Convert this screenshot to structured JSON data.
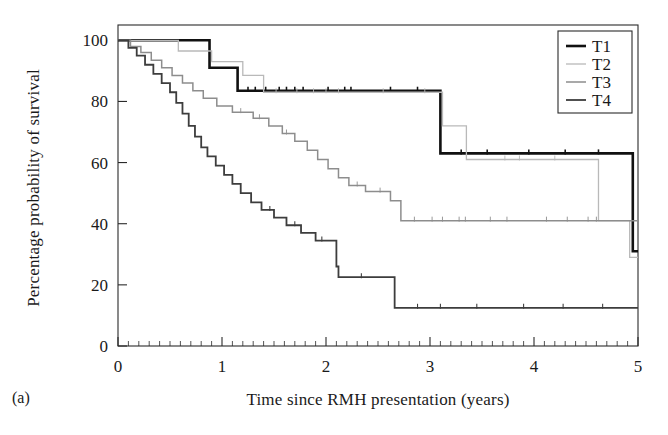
{
  "figure": {
    "panel_tag": "(a)",
    "xlabel": "Time since RMH presentation (years)",
    "ylabel": "Percentage probability of survival"
  },
  "chart_data": {
    "type": "line",
    "title": "",
    "subtitle": "",
    "xlabel": "Time since RMH presentation (years)",
    "ylabel": "Percentage probability of survival",
    "xlim": [
      0,
      5
    ],
    "ylim": [
      0,
      105
    ],
    "xticks": [
      0,
      1,
      2,
      3,
      4,
      5
    ],
    "yticks": [
      0,
      20,
      40,
      60,
      80,
      100
    ],
    "xtick_labels": [
      "0",
      "1",
      "2",
      "3",
      "4",
      "5"
    ],
    "ytick_labels": [
      "0",
      "20",
      "40",
      "60",
      "80",
      "100"
    ],
    "x_minor_tick_interval": 0.1,
    "grid": false,
    "legend_position": "top-right",
    "curve_style": "step-post (Kaplan-Meier survival curves with censor ticks)",
    "series": [
      {
        "name": "T1",
        "color": "#111111",
        "width": 2.6,
        "final_value": 31,
        "steps": [
          [
            0.0,
            100
          ],
          [
            0.88,
            100
          ],
          [
            0.88,
            91.0
          ],
          [
            1.15,
            91.0
          ],
          [
            1.15,
            83.5
          ],
          [
            3.1,
            83.5
          ],
          [
            3.1,
            63.0
          ],
          [
            4.95,
            63.0
          ],
          [
            4.95,
            31.0
          ],
          [
            5.0,
            31.0
          ]
        ],
        "censor_ticks": [
          1.25,
          1.32,
          1.42,
          1.55,
          1.62,
          1.7,
          1.78,
          2.02,
          2.18,
          2.24,
          2.62,
          2.88,
          3.3,
          3.55,
          3.95,
          4.3,
          4.62
        ]
      },
      {
        "name": "T2",
        "color": "#b9b9b9",
        "width": 1.3,
        "final_value": 29,
        "steps": [
          [
            0.0,
            100
          ],
          [
            0.58,
            100
          ],
          [
            0.58,
            96.5
          ],
          [
            0.9,
            96.5
          ],
          [
            0.9,
            93.0
          ],
          [
            1.2,
            93.0
          ],
          [
            1.2,
            88.5
          ],
          [
            1.4,
            88.5
          ],
          [
            1.4,
            83.0
          ],
          [
            3.12,
            83.0
          ],
          [
            3.12,
            72.0
          ],
          [
            3.35,
            72.0
          ],
          [
            3.35,
            61.0
          ],
          [
            4.62,
            61.0
          ],
          [
            4.62,
            41.0
          ],
          [
            4.92,
            41.0
          ],
          [
            4.92,
            29.0
          ],
          [
            5.0,
            29.0
          ]
        ],
        "censor_ticks": [
          1.52,
          1.72,
          1.88,
          2.0,
          2.12,
          2.55,
          2.95,
          3.72,
          3.86,
          4.2
        ]
      },
      {
        "name": "T3",
        "color": "#8d8d8d",
        "width": 1.5,
        "final_value": 41,
        "steps": [
          [
            0.0,
            100
          ],
          [
            0.12,
            100
          ],
          [
            0.12,
            98.0
          ],
          [
            0.22,
            98.0
          ],
          [
            0.22,
            96.0
          ],
          [
            0.32,
            96.0
          ],
          [
            0.32,
            93.5
          ],
          [
            0.42,
            93.5
          ],
          [
            0.42,
            91.0
          ],
          [
            0.52,
            91.0
          ],
          [
            0.52,
            88.5
          ],
          [
            0.62,
            88.5
          ],
          [
            0.62,
            86.0
          ],
          [
            0.72,
            86.0
          ],
          [
            0.72,
            83.5
          ],
          [
            0.82,
            83.5
          ],
          [
            0.82,
            81.0
          ],
          [
            0.95,
            81.0
          ],
          [
            0.95,
            78.5
          ],
          [
            1.1,
            78.5
          ],
          [
            1.1,
            76.5
          ],
          [
            1.3,
            76.5
          ],
          [
            1.3,
            74.5
          ],
          [
            1.45,
            74.5
          ],
          [
            1.45,
            72.0
          ],
          [
            1.58,
            72.0
          ],
          [
            1.58,
            69.5
          ],
          [
            1.7,
            69.5
          ],
          [
            1.7,
            67.0
          ],
          [
            1.82,
            67.0
          ],
          [
            1.82,
            64.0
          ],
          [
            1.92,
            64.0
          ],
          [
            1.92,
            61.0
          ],
          [
            2.02,
            61.0
          ],
          [
            2.02,
            58.0
          ],
          [
            2.12,
            58.0
          ],
          [
            2.12,
            55.0
          ],
          [
            2.22,
            55.0
          ],
          [
            2.22,
            52.5
          ],
          [
            2.38,
            52.5
          ],
          [
            2.38,
            50.5
          ],
          [
            2.62,
            50.5
          ],
          [
            2.62,
            47.5
          ],
          [
            2.72,
            47.5
          ],
          [
            2.72,
            41.0
          ],
          [
            5.0,
            41.0
          ]
        ],
        "censor_ticks": [
          1.18,
          1.36,
          1.62,
          2.3,
          2.52,
          2.85,
          3.02,
          3.12,
          3.28,
          3.34,
          3.58,
          3.74,
          4.12,
          4.32,
          4.52,
          4.6
        ]
      },
      {
        "name": "T4",
        "color": "#3d3d3d",
        "width": 1.8,
        "final_value": 12.5,
        "steps": [
          [
            0.0,
            100
          ],
          [
            0.1,
            100
          ],
          [
            0.1,
            97.5
          ],
          [
            0.18,
            97.5
          ],
          [
            0.18,
            95.0
          ],
          [
            0.26,
            95.0
          ],
          [
            0.26,
            92.0
          ],
          [
            0.34,
            92.0
          ],
          [
            0.34,
            89.0
          ],
          [
            0.42,
            89.0
          ],
          [
            0.42,
            86.0
          ],
          [
            0.5,
            86.0
          ],
          [
            0.5,
            83.0
          ],
          [
            0.56,
            83.0
          ],
          [
            0.56,
            79.5
          ],
          [
            0.62,
            79.5
          ],
          [
            0.62,
            76.0
          ],
          [
            0.68,
            76.0
          ],
          [
            0.68,
            72.0
          ],
          [
            0.74,
            72.0
          ],
          [
            0.74,
            68.5
          ],
          [
            0.8,
            68.5
          ],
          [
            0.8,
            65.0
          ],
          [
            0.86,
            65.0
          ],
          [
            0.86,
            62.0
          ],
          [
            0.94,
            62.0
          ],
          [
            0.94,
            59.0
          ],
          [
            1.02,
            59.0
          ],
          [
            1.02,
            56.0
          ],
          [
            1.1,
            56.0
          ],
          [
            1.1,
            53.0
          ],
          [
            1.18,
            53.0
          ],
          [
            1.18,
            50.0
          ],
          [
            1.28,
            50.0
          ],
          [
            1.28,
            47.0
          ],
          [
            1.38,
            47.0
          ],
          [
            1.38,
            44.5
          ],
          [
            1.5,
            44.5
          ],
          [
            1.5,
            42.0
          ],
          [
            1.62,
            42.0
          ],
          [
            1.62,
            39.5
          ],
          [
            1.76,
            39.5
          ],
          [
            1.76,
            37.0
          ],
          [
            1.9,
            37.0
          ],
          [
            1.9,
            34.5
          ],
          [
            2.1,
            34.5
          ],
          [
            2.1,
            26.0
          ],
          [
            2.12,
            26.0
          ],
          [
            2.12,
            22.5
          ],
          [
            2.66,
            22.5
          ],
          [
            2.66,
            12.5
          ],
          [
            5.0,
            12.5
          ]
        ],
        "censor_ticks": [
          1.46,
          1.7,
          1.96,
          2.34,
          2.88,
          3.1,
          3.45,
          3.9,
          4.28,
          4.66
        ]
      }
    ]
  },
  "legend": {
    "items": [
      {
        "label": "T1"
      },
      {
        "label": "T2"
      },
      {
        "label": "T3"
      },
      {
        "label": "T4"
      }
    ]
  }
}
